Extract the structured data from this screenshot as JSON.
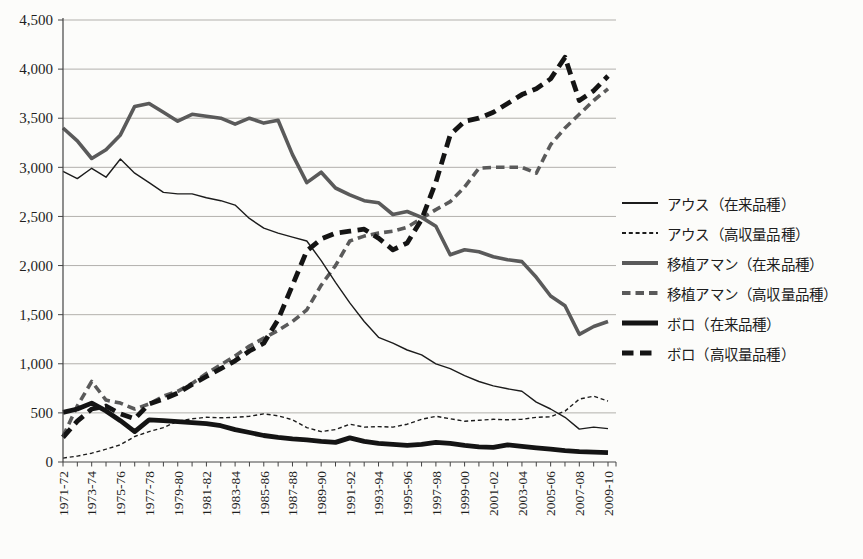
{
  "figure": {
    "kind": "scanned line chart, no title, legend at right",
    "background": "#fcfcfa"
  },
  "chart_data": {
    "type": "line",
    "title": "",
    "xlabel": "",
    "ylabel": "",
    "ylim": [
      0,
      4500
    ],
    "ytick_step": 500,
    "grid": "horizontal",
    "legend_position": "right",
    "n_points": 39,
    "x_unit": "fiscal year, yearly points; tick labels shown every 2 years",
    "x_tick_labels": [
      "1971-72",
      "1973-74",
      "1975-76",
      "1977-78",
      "1979-80",
      "1981-82",
      "1983-84",
      "1985-86",
      "1987-88",
      "1989-90",
      "1991-92",
      "1993-94",
      "1995-96",
      "1997-98",
      "1999-00",
      "2001-02",
      "2003-04",
      "2005-06",
      "2007-08",
      "2009-10"
    ],
    "y_tick_labels": [
      "0",
      "500",
      "1,000",
      "1,500",
      "2,000",
      "2,500",
      "3,000",
      "3,500",
      "4,000",
      "4,500"
    ],
    "series": [
      {
        "name": "アウス（在来品種）",
        "style": "thin-solid",
        "color": "#1c1c1c",
        "width": 1.4,
        "dash": null,
        "values": [
          2960,
          2885,
          2990,
          2900,
          3085,
          2940,
          2845,
          2745,
          2730,
          2730,
          2690,
          2660,
          2615,
          2480,
          2380,
          2330,
          2290,
          2250,
          2050,
          1830,
          1620,
          1430,
          1270,
          1210,
          1140,
          1090,
          1000,
          950,
          880,
          820,
          775,
          745,
          720,
          610,
          540,
          455,
          335,
          355,
          340
        ]
      },
      {
        "name": "アウス（高収量品種）",
        "style": "thin-dashed",
        "color": "#1c1c1c",
        "width": 1.4,
        "dash": "4 2.8",
        "values": [
          40,
          60,
          90,
          130,
          175,
          260,
          310,
          350,
          415,
          440,
          455,
          450,
          455,
          465,
          490,
          470,
          430,
          350,
          310,
          330,
          385,
          355,
          360,
          355,
          385,
          435,
          465,
          440,
          415,
          425,
          435,
          430,
          435,
          455,
          460,
          518,
          640,
          670,
          620
        ]
      },
      {
        "name": "移植アマン（在来品種）",
        "style": "thick-solid",
        "color": "#5a5a5a",
        "width": 3.6,
        "dash": null,
        "values": [
          3400,
          3270,
          3090,
          3180,
          3330,
          3620,
          3650,
          3560,
          3470,
          3540,
          3520,
          3500,
          3440,
          3500,
          3450,
          3480,
          3130,
          2845,
          2950,
          2790,
          2720,
          2660,
          2640,
          2520,
          2550,
          2490,
          2400,
          2110,
          2160,
          2140,
          2090,
          2060,
          2040,
          1880,
          1690,
          1590,
          1300,
          1380,
          1430
        ]
      },
      {
        "name": "移植アマン（高収量品種）",
        "style": "thick-dashed",
        "color": "#5a5a5a",
        "width": 3.6,
        "dash": "8.5 5",
        "values": [
          260,
          570,
          820,
          630,
          600,
          540,
          590,
          670,
          720,
          800,
          900,
          990,
          1080,
          1180,
          1260,
          1340,
          1430,
          1550,
          1800,
          2000,
          2250,
          2300,
          2330,
          2350,
          2390,
          2480,
          2570,
          2650,
          2800,
          2990,
          3000,
          3000,
          3000,
          2940,
          3230,
          3400,
          3540,
          3680,
          3800
        ]
      },
      {
        "name": "ボロ（在来品種）",
        "style": "heavy-solid",
        "color": "#141414",
        "width": 4.8,
        "dash": null,
        "values": [
          505,
          540,
          600,
          520,
          420,
          310,
          430,
          420,
          410,
          400,
          390,
          370,
          330,
          300,
          270,
          250,
          235,
          225,
          210,
          200,
          245,
          210,
          190,
          180,
          170,
          180,
          200,
          190,
          170,
          155,
          150,
          175,
          160,
          145,
          130,
          115,
          105,
          100,
          95
        ]
      },
      {
        "name": "ボロ（高収量品種）",
        "style": "heavy-dashed",
        "color": "#141414",
        "width": 4.8,
        "dash": "11.5 6.5",
        "values": [
          250,
          415,
          540,
          570,
          490,
          440,
          590,
          640,
          700,
          790,
          870,
          950,
          1030,
          1130,
          1210,
          1450,
          1800,
          2150,
          2270,
          2330,
          2350,
          2370,
          2280,
          2160,
          2230,
          2470,
          2850,
          3330,
          3470,
          3500,
          3560,
          3650,
          3740,
          3800,
          3900,
          4120,
          3680,
          3780,
          3930
        ]
      }
    ]
  }
}
